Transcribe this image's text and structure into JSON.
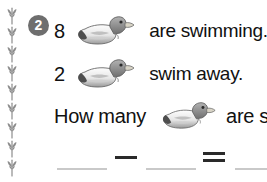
{
  "worksheet": {
    "problem_number": "2",
    "lines": [
      {
        "id": "line-1",
        "number": "8",
        "icon": "duck-icon",
        "text": "are swimming."
      },
      {
        "id": "line-2",
        "number": "2",
        "icon": "duck-icon",
        "text": "swim away."
      },
      {
        "id": "line-3",
        "question_prefix": "How many",
        "icon": "duck-icon",
        "question_suffix": "are  s"
      }
    ],
    "equation": {
      "blank_1": "",
      "operator_minus": "−",
      "blank_2": "",
      "operator_equals": "=",
      "blank_3": ""
    },
    "decoration": {
      "border_icon": "sprig-icon",
      "border_count": 9
    },
    "colors": {
      "badge_background": "#6e6e6e",
      "badge_text": "#ffffff",
      "body_text": "#111111",
      "blank_line": "#c9c9c9",
      "operator": "#2a2a2a",
      "sprig": "#8c8c8c",
      "page_background": "#ffffff"
    }
  }
}
